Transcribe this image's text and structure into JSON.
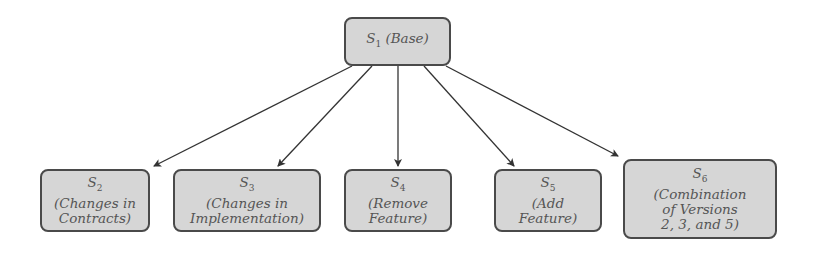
{
  "diagram": {
    "root": {
      "id": "S1",
      "symbol": "S",
      "subscript": "1",
      "label_lines": [
        "(Base)"
      ],
      "inline": true
    },
    "children": [
      {
        "id": "S2",
        "symbol": "S",
        "subscript": "2",
        "label_lines": [
          "(Changes in",
          "Contracts)"
        ]
      },
      {
        "id": "S3",
        "symbol": "S",
        "subscript": "3",
        "label_lines": [
          "(Changes in",
          "Implementation)"
        ]
      },
      {
        "id": "S4",
        "symbol": "S",
        "subscript": "4",
        "label_lines": [
          "(Remove",
          "Feature)"
        ]
      },
      {
        "id": "S5",
        "symbol": "S",
        "subscript": "5",
        "label_lines": [
          "(Add",
          "Feature)"
        ]
      },
      {
        "id": "S6",
        "symbol": "S",
        "subscript": "6",
        "label_lines": [
          "(Combination",
          "of Versions",
          "2, 3, and 5)"
        ]
      }
    ],
    "edges": [
      {
        "from": "S1",
        "to": "S2"
      },
      {
        "from": "S1",
        "to": "S3"
      },
      {
        "from": "S1",
        "to": "S4"
      },
      {
        "from": "S1",
        "to": "S5"
      },
      {
        "from": "S1",
        "to": "S6"
      }
    ],
    "colors": {
      "box_fill": "#d6d6d6",
      "box_border": "#4a4a4a",
      "arrow": "#333333",
      "text": "#555555"
    }
  }
}
